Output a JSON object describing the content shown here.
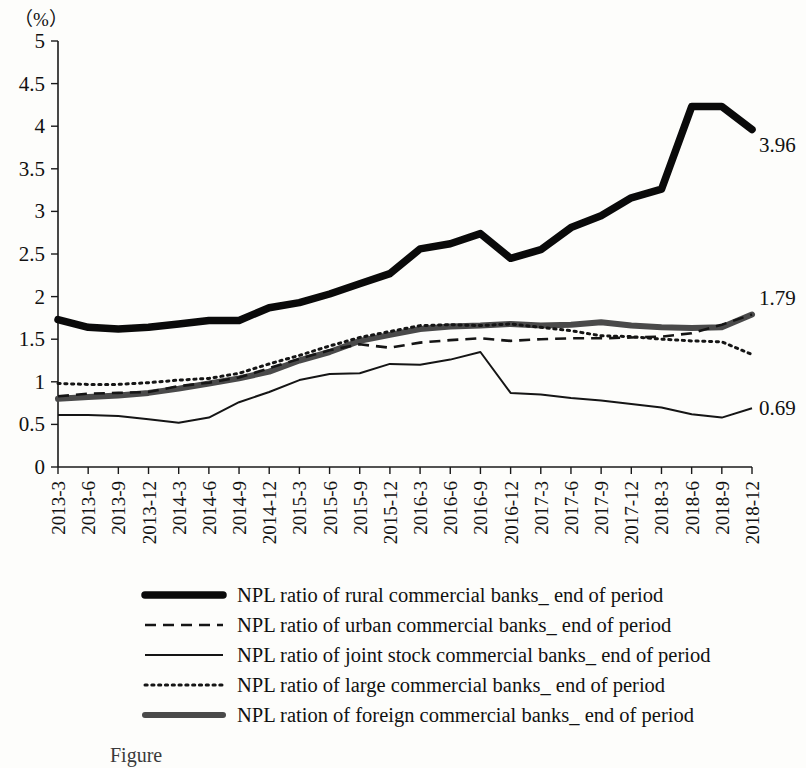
{
  "chart_data": {
    "type": "line",
    "title": "",
    "unit_label": "（%）",
    "xlabel": "",
    "ylabel": "",
    "ylim": [
      0,
      5
    ],
    "ytick_values": [
      0,
      0.5,
      1,
      1.5,
      2,
      2.5,
      3,
      3.5,
      4,
      4.5,
      5
    ],
    "ytick_labels": [
      "0",
      "0.5",
      "1",
      "1.5",
      "2",
      "2.5",
      "3",
      "3.5",
      "4",
      "4.5",
      "5"
    ],
    "grid": false,
    "legend_position": "bottom",
    "categories": [
      "2013-3",
      "2013-6",
      "2013-9",
      "2013-12",
      "2014-3",
      "2014-6",
      "2014-9",
      "2014-12",
      "2015-3",
      "2015-6",
      "2015-9",
      "2015-12",
      "2016-3",
      "2016-6",
      "2016-9",
      "2016-12",
      "2017-3",
      "2017-6",
      "2017-9",
      "2017-12",
      "2018-3",
      "2018-6",
      "2018-9",
      "2018-12"
    ],
    "series": [
      {
        "name": "NPL ratio of rural commercial banks_ end of period",
        "style": "thick-solid",
        "color": "#0a0a0a",
        "end_label": "3.96",
        "values": [
          1.73,
          1.64,
          1.62,
          1.64,
          1.68,
          1.72,
          1.72,
          1.87,
          1.93,
          2.03,
          2.15,
          2.27,
          2.56,
          2.62,
          2.74,
          2.45,
          2.55,
          2.81,
          2.95,
          3.16,
          3.26,
          4.23,
          4.23,
          3.96
        ]
      },
      {
        "name": "NPL ratio of urban commercial banks_ end of period",
        "style": "dashed",
        "color": "#151515",
        "end_label": "",
        "values": [
          0.83,
          0.86,
          0.87,
          0.88,
          0.95,
          0.99,
          1.05,
          1.16,
          1.27,
          1.37,
          1.44,
          1.4,
          1.46,
          1.49,
          1.51,
          1.48,
          1.5,
          1.51,
          1.51,
          1.52,
          1.53,
          1.57,
          1.67,
          1.79
        ]
      },
      {
        "name": "NPL ratio of  joint stock commercial banks_ end of period",
        "style": "thin-solid",
        "color": "#151515",
        "end_label": "0.69",
        "values": [
          0.61,
          0.61,
          0.6,
          0.56,
          0.52,
          0.58,
          0.76,
          0.88,
          1.02,
          1.09,
          1.1,
          1.21,
          1.2,
          1.26,
          1.35,
          0.87,
          0.85,
          0.81,
          0.78,
          0.74,
          0.7,
          0.62,
          0.58,
          0.69
        ]
      },
      {
        "name": "NPL ratio of large commercial banks_ end of period",
        "style": "dotted",
        "color": "#151515",
        "end_label": "",
        "values": [
          0.98,
          0.97,
          0.97,
          0.99,
          1.02,
          1.04,
          1.1,
          1.21,
          1.31,
          1.42,
          1.52,
          1.59,
          1.66,
          1.67,
          1.66,
          1.68,
          1.64,
          1.6,
          1.54,
          1.53,
          1.5,
          1.48,
          1.47,
          1.32
        ]
      },
      {
        "name": "NPL ration of foreign commercial banks_ end of period",
        "style": "thick-grey",
        "color": "#4a4a4a",
        "end_label": "1.79",
        "values": [
          0.8,
          0.82,
          0.84,
          0.87,
          0.92,
          0.98,
          1.04,
          1.12,
          1.25,
          1.35,
          1.48,
          1.55,
          1.62,
          1.65,
          1.66,
          1.68,
          1.66,
          1.67,
          1.7,
          1.66,
          1.64,
          1.63,
          1.64,
          1.79
        ]
      }
    ],
    "end_labels": [
      {
        "text": "3.96",
        "value": 3.96
      },
      {
        "text": "1.79",
        "value": 1.79
      },
      {
        "text": "0.69",
        "value": 0.69
      }
    ]
  },
  "legend": {
    "items": [
      {
        "label": "NPL ratio of rural commercial banks_ end of period",
        "style": "thick-solid"
      },
      {
        "label": "NPL ratio of urban commercial banks_ end of period",
        "style": "dashed"
      },
      {
        "label": "NPL ratio of  joint stock commercial banks_ end of period",
        "style": "thin-solid"
      },
      {
        "label": "NPL ratio of large commercial banks_ end of period",
        "style": "dotted"
      },
      {
        "label": "NPL ration of foreign commercial banks_ end of period",
        "style": "thick-grey"
      }
    ]
  },
  "caption": {
    "text": "Figure"
  }
}
